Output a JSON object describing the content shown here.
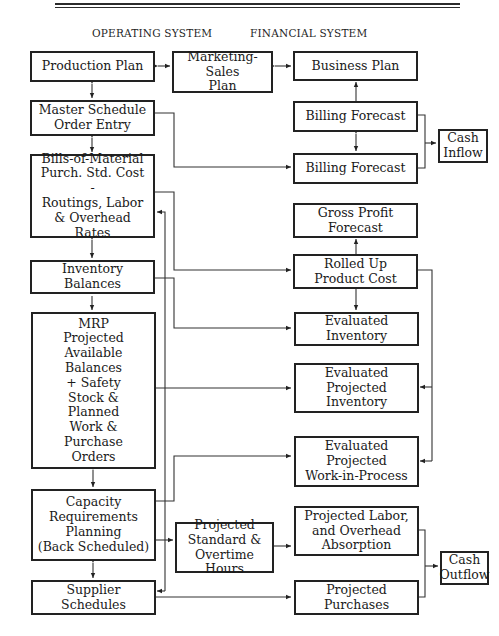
{
  "headers": {
    "operating": "OPERATING SYSTEM",
    "financial": "FINANCIAL SYSTEM"
  },
  "operating_system": {
    "production_plan": "Production Plan",
    "master_schedule": "Master Schedule\nOrder Entry",
    "bills_of_material": "Bills-of-Material\nPurch. Std. Cost\n-\nRoutings, Labor\n& Overhead Rates",
    "inventory_balances": "Inventory\nBalances",
    "mrp": "MRP\nProjected\nAvailable\nBalances\n+ Safety\nStock &\nPlanned\nWork &\nPurchase\nOrders",
    "capacity_planning": "Capacity\nRequirements\nPlanning\n(Back Scheduled)",
    "supplier_schedules": "Supplier\nSchedules"
  },
  "middle": {
    "marketing_sales_plan": "Marketing-Sales\nPlan",
    "projected_hours": "Projected\nStandard &\nOvertime Hours"
  },
  "financial_system": {
    "business_plan": "Business Plan",
    "billing_forecast_1": "Billing Forecast",
    "billing_forecast_2": "Billing Forecast",
    "gross_profit_forecast": "Gross Profit\nForecast",
    "rolled_up_cost": "Rolled Up\nProduct Cost",
    "evaluated_inventory": "Evaluated\nInventory",
    "evaluated_projected_inventory": "Evaluated\nProjected\nInventory",
    "evaluated_projected_wip": "Evaluated\nProjected\nWork-in-Process",
    "projected_labor_absorption": "Projected Labor,\nand Overhead\nAbsorption",
    "projected_purchases": "Projected\nPurchases"
  },
  "outputs": {
    "cash_inflow": "Cash\nInflow",
    "cash_outflow": "Cash\nOutflow"
  }
}
